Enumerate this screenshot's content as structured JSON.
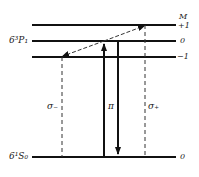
{
  "diagram": {
    "upper_state": "6³P₁",
    "lower_state": "6¹S₀",
    "m_header": "M",
    "levels": [
      {
        "m": "+1"
      },
      {
        "m": "0"
      },
      {
        "m": "−1"
      },
      {
        "m": "0"
      }
    ],
    "transitions": {
      "sigma_minus": "σ₋",
      "pi": "π",
      "sigma_plus": "σ₊"
    }
  }
}
